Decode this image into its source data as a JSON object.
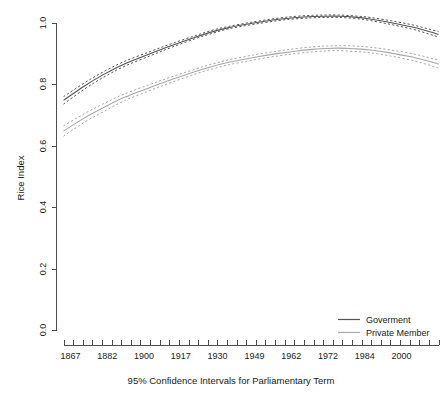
{
  "chart_data": {
    "type": "line",
    "title": "",
    "xlabel": "95% Confidence Intervals for Parliamentary Term",
    "ylabel": "Rice Index",
    "ylim": [
      0.0,
      1.0
    ],
    "ytick_labels": [
      "0.0",
      "0.2",
      "0.4",
      "0.6",
      "0.8",
      "1.0"
    ],
    "ytick_values": [
      0.0,
      0.2,
      0.4,
      0.6,
      0.8,
      1.0
    ],
    "xtick_labels": [
      "1867",
      "1882",
      "1900",
      "1917",
      "1930",
      "1949",
      "1962",
      "1972",
      "1984",
      "2000"
    ],
    "xtick_values": [
      1867,
      1882,
      1900,
      1917,
      1930,
      1949,
      1962,
      1972,
      1984,
      2000
    ],
    "xlim": [
      1867,
      2010
    ],
    "x_minor_tick_count": 40,
    "grid": false,
    "legend_position": "bottom-right",
    "legend": [
      {
        "label": "Goverment",
        "color": "#555555",
        "style": "solid"
      },
      {
        "label": "Private Member",
        "color": "#a8a8a8",
        "style": "solid"
      }
    ],
    "x": [
      1867,
      1875,
      1882,
      1890,
      1900,
      1908,
      1917,
      1924,
      1930,
      1939,
      1949,
      1956,
      1962,
      1967,
      1972,
      1978,
      1984,
      1992,
      2000,
      2006,
      2010
    ],
    "series": [
      {
        "name": "Goverment",
        "color": "#555555",
        "style": "solid",
        "values": [
          0.748,
          0.795,
          0.831,
          0.866,
          0.9,
          0.926,
          0.953,
          0.972,
          0.985,
          0.999,
          1.012,
          1.018,
          1.021,
          1.022,
          1.022,
          1.019,
          1.013,
          1.001,
          0.987,
          0.973,
          0.963
        ],
        "ci_upper": [
          0.76,
          0.805,
          0.84,
          0.874,
          0.907,
          0.932,
          0.958,
          0.977,
          0.989,
          1.003,
          1.016,
          1.022,
          1.025,
          1.026,
          1.026,
          1.023,
          1.018,
          1.007,
          0.994,
          0.981,
          0.972
        ],
        "ci_lower": [
          0.736,
          0.785,
          0.822,
          0.858,
          0.893,
          0.92,
          0.948,
          0.967,
          0.981,
          0.995,
          1.008,
          1.014,
          1.017,
          1.018,
          1.018,
          1.015,
          1.008,
          0.995,
          0.98,
          0.965,
          0.954
        ]
      },
      {
        "name": "Private Member",
        "color": "#a8a8a8",
        "style": "solid",
        "values": [
          0.648,
          0.691,
          0.723,
          0.757,
          0.79,
          0.815,
          0.841,
          0.859,
          0.872,
          0.887,
          0.901,
          0.909,
          0.914,
          0.917,
          0.918,
          0.916,
          0.912,
          0.902,
          0.889,
          0.876,
          0.866
        ],
        "ci_upper": [
          0.665,
          0.705,
          0.736,
          0.768,
          0.8,
          0.824,
          0.849,
          0.867,
          0.88,
          0.895,
          0.909,
          0.917,
          0.922,
          0.925,
          0.926,
          0.925,
          0.921,
          0.912,
          0.9,
          0.888,
          0.879
        ],
        "ci_lower": [
          0.631,
          0.677,
          0.71,
          0.746,
          0.78,
          0.806,
          0.833,
          0.851,
          0.864,
          0.879,
          0.893,
          0.901,
          0.906,
          0.909,
          0.91,
          0.907,
          0.903,
          0.892,
          0.878,
          0.864,
          0.853
        ]
      }
    ]
  },
  "colors": {
    "government": "#555555",
    "private_member": "#a8a8a8",
    "axis": "#4d4d4d",
    "text": "#1a1a1a",
    "background": "#ffffff"
  }
}
